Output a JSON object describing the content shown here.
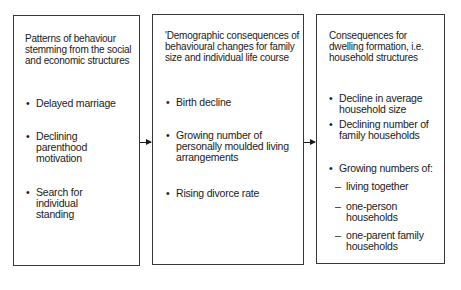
{
  "diagram": {
    "boxes": [
      {
        "title": "Patterns of behaviour stemming from the social and economic structures",
        "items": [
          "Delayed marriage",
          "Declining parenthood motivation",
          "Search for individual standing"
        ]
      },
      {
        "title": "'Demographic consequences of behavioural changes for family size and individual life course",
        "items": [
          "Birth decline",
          "Growing number of personally moulded living arrangements",
          "Rising divorce rate"
        ]
      },
      {
        "title": "Consequences for dwelling formation, i.e. household structures",
        "items": [
          "Decline in average household size",
          "Declining number of family households",
          "Growing numbers of:"
        ],
        "subitems": [
          "living together",
          "one-person households",
          "one-parent family households"
        ]
      }
    ],
    "bullet": "•",
    "dash": "–",
    "arrows": [
      "box1-to-box2",
      "box2-to-box3"
    ]
  }
}
